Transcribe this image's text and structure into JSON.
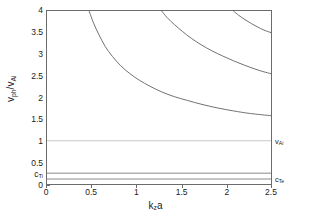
{
  "chart_data": {
    "type": "line",
    "title": "",
    "xlabel": "k_z a",
    "ylabel": "v_ph/v_Ai",
    "xlim": [
      0,
      2.5
    ],
    "ylim": [
      0,
      4
    ],
    "xticks": [
      "0",
      "0.5",
      "1",
      "1.5",
      "2",
      "2.5"
    ],
    "xtick_values": [
      0,
      0.5,
      1,
      1.5,
      2,
      2.5
    ],
    "yticks": [
      "0",
      "0.5",
      "1",
      "1.5",
      "2",
      "2.5",
      "3",
      "3.5",
      "4"
    ],
    "ytick_values": [
      0,
      0.5,
      1,
      1.5,
      2,
      2.5,
      3,
      3.5,
      4
    ],
    "grid": false,
    "legend": "none",
    "special_ytick_label": "c_Ti",
    "special_ytick_value": 0.25,
    "series": [
      {
        "name": "branch-1",
        "color": "#707070",
        "points": [
          [
            0.47,
            4.0
          ],
          [
            0.52,
            3.72
          ],
          [
            0.58,
            3.45
          ],
          [
            0.65,
            3.18
          ],
          [
            0.73,
            2.95
          ],
          [
            0.82,
            2.74
          ],
          [
            0.92,
            2.56
          ],
          [
            1.03,
            2.4
          ],
          [
            1.15,
            2.26
          ],
          [
            1.28,
            2.13
          ],
          [
            1.42,
            2.02
          ],
          [
            1.57,
            1.93
          ],
          [
            1.73,
            1.84
          ],
          [
            1.9,
            1.76
          ],
          [
            2.08,
            1.69
          ],
          [
            2.27,
            1.63
          ],
          [
            2.5,
            1.58
          ]
        ]
      },
      {
        "name": "branch-2",
        "color": "#707070",
        "points": [
          [
            1.28,
            4.0
          ],
          [
            1.34,
            3.85
          ],
          [
            1.42,
            3.69
          ],
          [
            1.51,
            3.53
          ],
          [
            1.61,
            3.37
          ],
          [
            1.72,
            3.22
          ],
          [
            1.84,
            3.08
          ],
          [
            1.96,
            2.96
          ],
          [
            2.08,
            2.85
          ],
          [
            2.2,
            2.75
          ],
          [
            2.32,
            2.66
          ],
          [
            2.41,
            2.6
          ],
          [
            2.5,
            2.55
          ]
        ]
      },
      {
        "name": "branch-3",
        "color": "#707070",
        "points": [
          [
            2.08,
            4.0
          ],
          [
            2.14,
            3.9
          ],
          [
            2.21,
            3.8
          ],
          [
            2.28,
            3.71
          ],
          [
            2.35,
            3.63
          ],
          [
            2.42,
            3.56
          ],
          [
            2.5,
            3.5
          ]
        ]
      },
      {
        "name": "v_Ai-reference-line",
        "color": "#c8c8c8",
        "constant_y": 1.0
      },
      {
        "name": "c_Ti-line",
        "color": "#8a8a8a",
        "constant_y": 0.25
      },
      {
        "name": "c_Te-line",
        "color": "#8a8a8a",
        "constant_y": 0.115
      }
    ],
    "annotations": [
      {
        "label": "v_Ai",
        "y": 1.0,
        "position": "right-outside"
      },
      {
        "label": "c_Te",
        "y": 0.115,
        "position": "right-outside"
      },
      {
        "label": "c_Ti",
        "y": 0.25,
        "position": "left-outside"
      }
    ]
  },
  "axis": {
    "y_title_main": "v",
    "y_title_sub1": "ph",
    "y_title_slash": "/v",
    "y_title_sub2": "Ai",
    "x_title_main": "k",
    "x_title_sub": "z",
    "x_title_tail": "a"
  },
  "labels": {
    "y0": "0",
    "y05": "0.5",
    "y1": "1",
    "y15": "1.5",
    "y2": "2",
    "y25": "2.5",
    "y3": "3",
    "y35": "3.5",
    "y4": "4",
    "x0": "0",
    "x05": "0.5",
    "x1": "1",
    "x15": "1.5",
    "x2": "2",
    "x25": "2.5",
    "cTi_main": "c",
    "cTi_sub": "Ti",
    "cTe_main": "c",
    "cTe_sub": "Te",
    "vAi_main": "v",
    "vAi_sub": "Ai"
  }
}
